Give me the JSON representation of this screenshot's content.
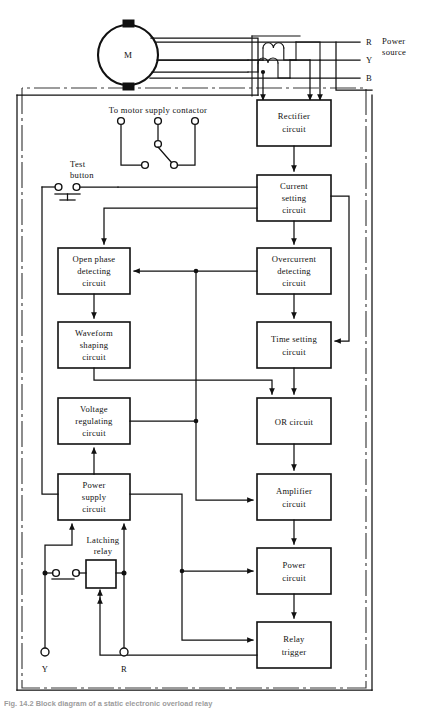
{
  "figure": {
    "caption": "Fig. 14.2 Block diagram of a static electronic overload relay"
  },
  "power_source": {
    "group_label": "Power source",
    "phases": [
      {
        "id": "R",
        "label": "R"
      },
      {
        "id": "Y",
        "label": "Y"
      },
      {
        "id": "B",
        "label": "B"
      }
    ]
  },
  "motor": {
    "label": "M",
    "name": "motor"
  },
  "annotations": {
    "contactor": "To motor supply contactor",
    "test_button_line1": "Test",
    "test_button_line2": "button",
    "latching_relay_line1": "Latching",
    "latching_relay_line2": "relay"
  },
  "terminals": [
    {
      "id": "Y",
      "label": "Y"
    },
    {
      "id": "R",
      "label": "R"
    }
  ],
  "blocks": [
    {
      "id": "rectifier",
      "lines": [
        "Rectifier",
        "circuit"
      ]
    },
    {
      "id": "current-setting",
      "lines": [
        "Current",
        "setting",
        "circuit"
      ]
    },
    {
      "id": "open-phase",
      "lines": [
        "Open phase",
        "detecting",
        "circuit"
      ]
    },
    {
      "id": "overcurrent",
      "lines": [
        "Overcurrent",
        "detecting",
        "circuit"
      ]
    },
    {
      "id": "waveform-shaping",
      "lines": [
        "Waveform",
        "shaping",
        "circuit"
      ]
    },
    {
      "id": "time-setting",
      "lines": [
        "Time setting",
        "circuit"
      ]
    },
    {
      "id": "voltage-regulating",
      "lines": [
        "Voltage",
        "regulating",
        "circuit"
      ]
    },
    {
      "id": "or-circuit",
      "lines": [
        "OR circuit"
      ]
    },
    {
      "id": "power-supply",
      "lines": [
        "Power",
        "supply",
        "circuit"
      ]
    },
    {
      "id": "amplifier",
      "lines": [
        "Amplifier",
        "circuit"
      ]
    },
    {
      "id": "power-circuit",
      "lines": [
        "Power",
        "circuit"
      ]
    },
    {
      "id": "relay-trigger",
      "lines": [
        "Relay",
        "trigger"
      ]
    }
  ],
  "colors": {
    "line": "#111111",
    "boundary": "#3a3a3a",
    "background": "#ffffff"
  }
}
